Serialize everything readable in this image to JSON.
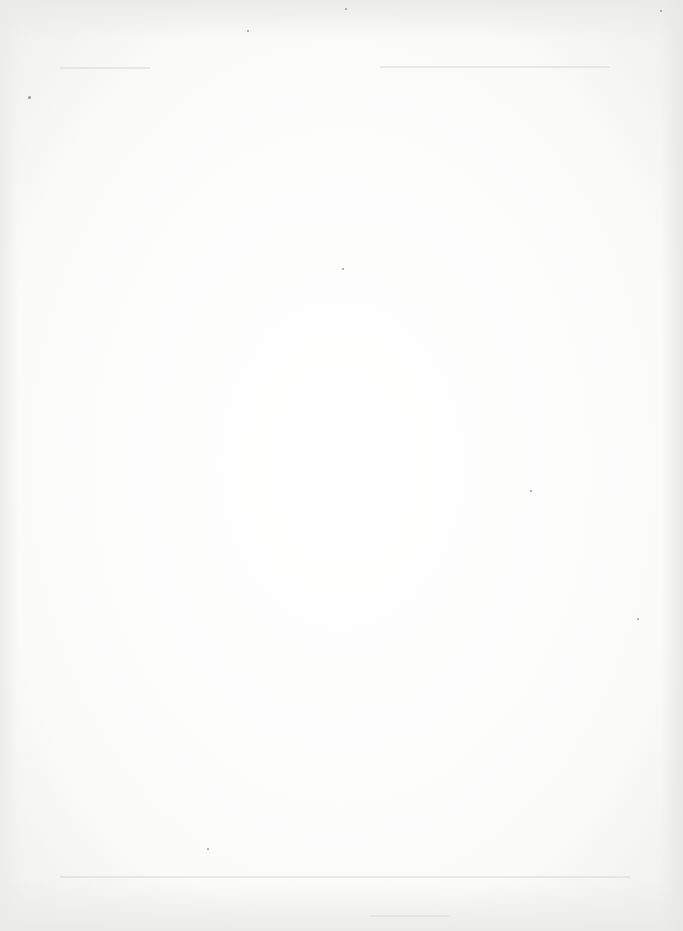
{
  "page": {
    "content": "",
    "background_color": "#ffffff",
    "edge_color": "#ebebe9"
  }
}
